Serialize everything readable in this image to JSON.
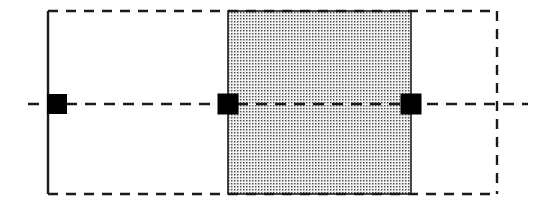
{
  "canvas": {
    "width": 546,
    "height": 212,
    "background_color": "#ffffff",
    "title": "Mechanical section drawing - hatched block on centerline"
  },
  "style": {
    "line_color": "#1a1a1a",
    "marker_color": "#000000",
    "hatch_dot_color": "#4d4d4d",
    "hatch_background_color": "#f2f2f2",
    "solid_line_width": 2.4,
    "dashed_line_width": 2.4,
    "dash_pattern": "10 8",
    "centerline_dash_pattern": "11 8"
  },
  "geometry": {
    "left_datum_line": {
      "label": "left-datum-line",
      "kind": "solid-vertical",
      "x": 48,
      "y_top": 11,
      "y_bottom": 194
    },
    "right_datum_line": {
      "label": "right-datum-line",
      "kind": "dashed-vertical",
      "x": 497,
      "y_top": 11,
      "y_bottom": 194
    },
    "top_boundary": {
      "label": "top-boundary-line",
      "kind": "dashed-horizontal",
      "y": 11,
      "x_start": 48,
      "x_end": 497
    },
    "bottom_boundary": {
      "label": "bottom-boundary-line",
      "kind": "dashed-horizontal",
      "y": 194,
      "x_start": 48,
      "x_end": 497
    },
    "centerline": {
      "label": "horizontal-centerline",
      "kind": "dashed-horizontal",
      "y": 104,
      "x_start": 28,
      "x_end": 528
    },
    "hatched_block": {
      "label": "hatched-block",
      "fill": "dot-stipple",
      "x": 228,
      "y": 11,
      "width": 183,
      "height": 183,
      "edge_kind": "solid"
    },
    "markers": [
      {
        "label": "marker-left",
        "cx": 57,
        "cy": 104,
        "size": 20
      },
      {
        "label": "marker-middle",
        "cx": 228,
        "cy": 104,
        "size": 21
      },
      {
        "label": "marker-right",
        "cx": 411,
        "cy": 104,
        "size": 21
      }
    ]
  }
}
